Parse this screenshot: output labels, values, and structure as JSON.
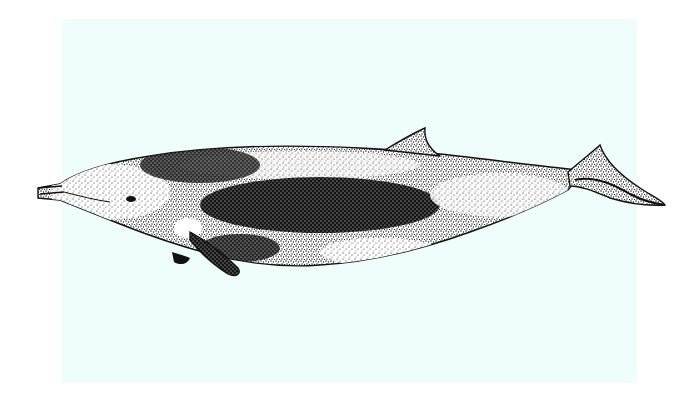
{
  "image": {
    "subject": "stippled illustration of a beaked whale, lateral view, facing left",
    "colors": {
      "page_background": "#ffffff",
      "panel_background": "#effefd",
      "ink": "#111111",
      "light_ink": "#ffffff"
    },
    "panel": {
      "x": 62,
      "y": 19,
      "width": 575,
      "height": 364
    },
    "parts": [
      "beak",
      "melon",
      "eye",
      "pectoral-fin",
      "dark-lateral-saddle",
      "dorsal-fin",
      "tail-stock",
      "flukes"
    ]
  }
}
